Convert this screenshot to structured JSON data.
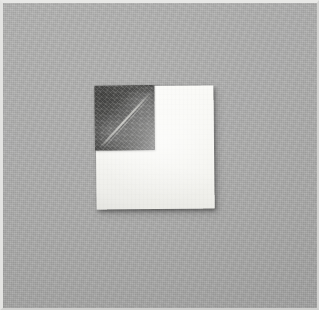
{
  "image": {
    "kind": "photograph",
    "subject": "paper-square-with-dark-treated-corner",
    "width": 319,
    "height": 310,
    "caption": ""
  },
  "frame": {
    "border_color": "#e8e8e6",
    "name": "photo-border"
  },
  "background": {
    "name": "gray-fabric-backdrop",
    "color": "#a9a9a8",
    "texture": "woven-cloth"
  },
  "specimen": {
    "paper": {
      "name": "white-paper-square",
      "color": "#faf9f6",
      "left": 96,
      "top": 86,
      "width": 118,
      "height": 123,
      "rotation_deg": -0.6
    },
    "patch": {
      "name": "dark-treated-quadrant",
      "color": "#5b5b59",
      "left": 0,
      "top": 0,
      "width": 60,
      "height": 65,
      "position": "top-left"
    },
    "crease": {
      "name": "diagonal-fold-crease",
      "color": "#d4d4cf",
      "angle_deg": -47,
      "direction": "bottom-left-to-top-right"
    },
    "shadow": {
      "name": "contact-shadow",
      "color": "rgba(0,0,0,0.22)"
    }
  }
}
